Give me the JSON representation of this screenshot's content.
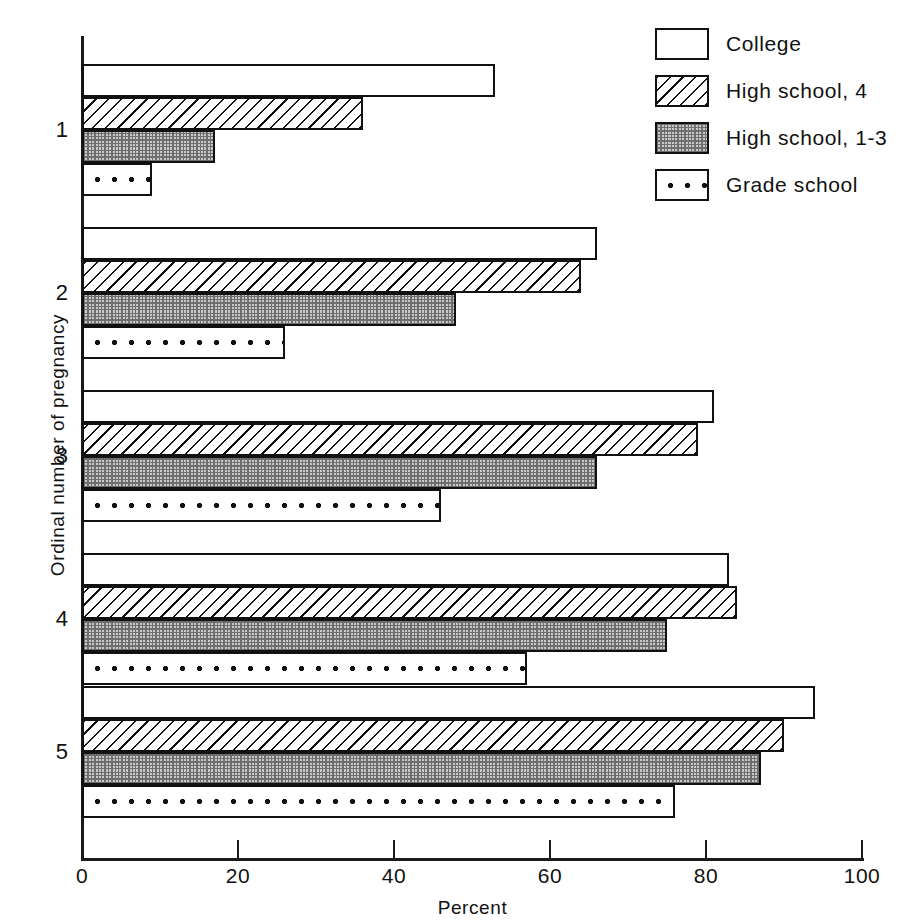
{
  "chart_data": {
    "type": "bar",
    "orientation": "horizontal",
    "title": "",
    "xlabel": "Percent",
    "ylabel": "Ordinal number of pregnancy",
    "xlim": [
      0,
      100
    ],
    "xticks": [
      0,
      20,
      40,
      60,
      80,
      100
    ],
    "xtick_labels": [
      "0",
      "20",
      "40",
      "60",
      "80",
      "100"
    ],
    "grid": false,
    "legend_position": "top-right",
    "categories": [
      "1",
      "2",
      "3",
      "4",
      "5"
    ],
    "series": [
      {
        "name": "College",
        "key": "college",
        "values": [
          53,
          66,
          81,
          83,
          94
        ]
      },
      {
        "name": "High school, 4",
        "key": "hs4",
        "values": [
          36,
          64,
          79,
          84,
          90
        ]
      },
      {
        "name": "High school, 1-3",
        "key": "hs13",
        "values": [
          17,
          48,
          66,
          75,
          87
        ]
      },
      {
        "name": "Grade school",
        "key": "grade",
        "values": [
          9,
          26,
          46,
          57,
          76
        ]
      }
    ]
  },
  "legend": {
    "items": [
      {
        "label": "College",
        "swatch": "open-swatch"
      },
      {
        "label": "High school, 4",
        "swatch": "diagonal-hatch-swatch"
      },
      {
        "label": "High school, 1-3",
        "swatch": "crosshatch-swatch"
      },
      {
        "label": "Grade school",
        "swatch": "dotted-swatch"
      }
    ]
  },
  "colors": {
    "ink": "#111111",
    "paper": "#ffffff",
    "shade": "#c9c9c9"
  }
}
